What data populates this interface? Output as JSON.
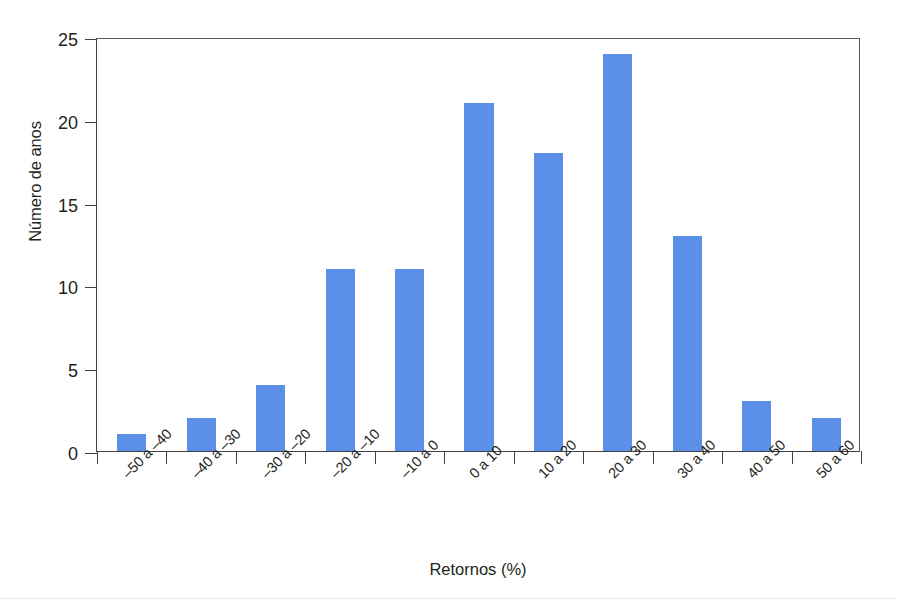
{
  "chart_data": {
    "type": "bar",
    "title": "",
    "subtitle": "",
    "xlabel": "Retornos (%)",
    "ylabel": "Número de anos",
    "categories": [
      "–50 a –40",
      "–40 a –30",
      "–30 a –20",
      "–20 a –10",
      "–10 a 0",
      "0 a 10",
      "10 a 20",
      "20 a 30",
      "30 a 40",
      "40 a 50",
      "50 a 60"
    ],
    "values": [
      1,
      2,
      4,
      11,
      11,
      21,
      18,
      24,
      13,
      3,
      2
    ],
    "ylim": [
      0,
      25
    ],
    "yticks": [
      0,
      5,
      10,
      15,
      20,
      25
    ],
    "ytick_labels": [
      "0",
      "5",
      "10",
      "15",
      "20",
      "25"
    ],
    "grid": false,
    "legend": false,
    "legend_position": "none",
    "bar_color": "#5b8fe8",
    "axis_color": "#414042",
    "background_color": "#ffffff"
  }
}
